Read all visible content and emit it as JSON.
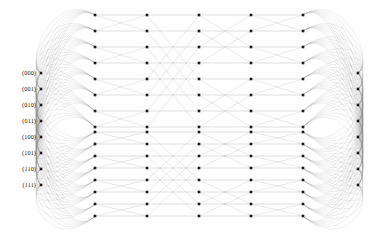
{
  "figure": {
    "type": "butterfly-network-graph",
    "background_color": "#ffffff",
    "node_color": "#1a1a1a",
    "edge_color": "#888888",
    "label_color": "#1a1a1a"
  },
  "row_labels": [
    "(000)",
    "(001)",
    "(010)",
    "(011)",
    "(100)",
    "(101)",
    "(110)",
    "(111)"
  ],
  "chart_data": {
    "type": "graph",
    "title": "",
    "xlabel": "",
    "ylabel": "",
    "column_count": 7,
    "terminal_node_count": 8,
    "interior_node_count": 16,
    "interior_block_split": 8,
    "columns": [
      {
        "index": 0,
        "x": 41,
        "kind": "terminal",
        "labelled": true,
        "node_count": 8
      },
      {
        "index": 1,
        "x": 95,
        "kind": "interior",
        "labelled": false,
        "node_count": 16
      },
      {
        "index": 2,
        "x": 147,
        "kind": "interior",
        "labelled": false,
        "node_count": 16
      },
      {
        "index": 3,
        "x": 199,
        "kind": "interior",
        "labelled": false,
        "node_count": 16
      },
      {
        "index": 4,
        "x": 251,
        "kind": "interior",
        "labelled": false,
        "node_count": 16
      },
      {
        "index": 5,
        "x": 303,
        "kind": "interior",
        "labelled": false,
        "node_count": 16
      },
      {
        "index": 6,
        "x": 358,
        "kind": "terminal",
        "labelled": false,
        "node_count": 8
      }
    ],
    "terminal_rows_y": [
      73,
      89,
      105,
      121,
      137,
      153,
      169,
      185
    ],
    "interior_top_rows_y": [
      15,
      31,
      47,
      63,
      79,
      95,
      111,
      113
    ],
    "interior_rows_y": [
      15,
      31,
      47,
      63,
      79,
      95,
      113,
      132,
      148,
      160,
      172,
      184,
      196,
      204,
      210,
      216
    ],
    "node_marker": "square",
    "node_size_px": 2.6,
    "grid": false,
    "legend": null,
    "axis_ranges": {
      "x": [
        0,
        373
      ],
      "y": [
        0,
        235
      ]
    }
  }
}
